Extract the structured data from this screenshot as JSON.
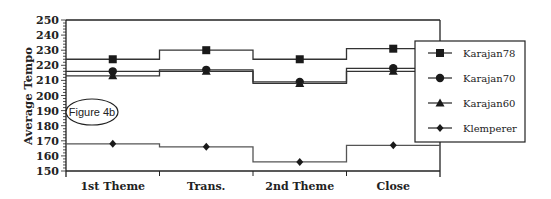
{
  "chart_data": {
    "type": "line",
    "subtype": "step",
    "title": "",
    "xlabel": "",
    "ylabel": "Average Tempo",
    "ylim": [
      150,
      250
    ],
    "yticks": [
      150,
      160,
      170,
      180,
      190,
      200,
      210,
      220,
      230,
      240,
      250
    ],
    "grid": false,
    "legend_position": "right",
    "categories": [
      "1st Theme",
      "Trans.",
      "2nd Theme",
      "Close"
    ],
    "series": [
      {
        "name": "Karajan78",
        "marker": "square",
        "values": [
          224,
          230,
          224,
          231
        ]
      },
      {
        "name": "Karajan70",
        "marker": "circle",
        "values": [
          216,
          217,
          209,
          218
        ]
      },
      {
        "name": "Karajan60",
        "marker": "triangle",
        "values": [
          213,
          216,
          208,
          216
        ]
      },
      {
        "name": "Klemperer",
        "marker": "diamond",
        "values": [
          168,
          166,
          156,
          167
        ]
      }
    ],
    "annotations": [
      {
        "text": "Figure 4b",
        "shape": "ellipse"
      }
    ]
  },
  "colors": {
    "line": "#333333",
    "marker": "#1a1a1a",
    "axis": "#222222"
  }
}
